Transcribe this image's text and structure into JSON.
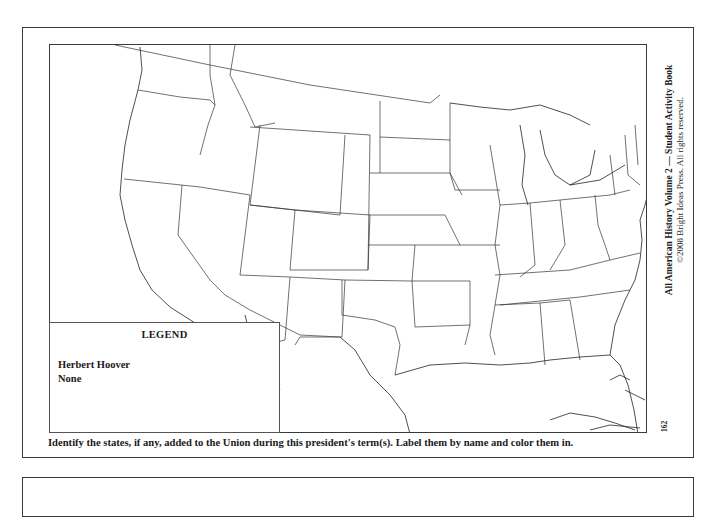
{
  "page": {
    "instructions": "Identify the states, if any, added to the Union during this president's term(s). Label them by name and color them in.",
    "page_number": "162",
    "credit": {
      "line1": "All American History Volume 2 — Student Activity Book",
      "line2": "©2008 Bright Ideas Press. All rights reserved."
    }
  },
  "map": {
    "description": "Outline map of the contiguous United States with state borders, Great Lakes, Gulf of Mexico, Caribbean islands",
    "stroke_color": "#333333",
    "background": "#ffffff"
  },
  "legend": {
    "title": "LEGEND",
    "president": "Herbert Hoover",
    "states_added": "None"
  }
}
